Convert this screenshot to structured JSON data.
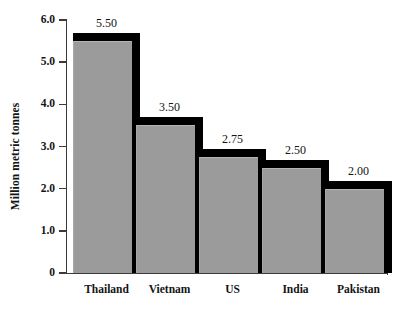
{
  "chart_data": {
    "type": "bar",
    "title": "",
    "subtitle": "",
    "xlabel": "",
    "ylabel": "Million metric tonnes",
    "categories": [
      "Thailand",
      "Vietnam",
      "US",
      "India",
      "Pakistan"
    ],
    "values": [
      5.5,
      3.5,
      2.75,
      2.5,
      2.0
    ],
    "data_labels": [
      "5.50",
      "3.50",
      "2.75",
      "2.50",
      "2.00"
    ],
    "ylim": [
      0,
      6.0
    ],
    "ytick_values": [
      6.0,
      5.0,
      4.0,
      3.0,
      2.0,
      1.0,
      0
    ],
    "ytick_labels": [
      "6.0",
      "5.0",
      "4.0",
      "3.0",
      "2.0",
      "1.0",
      "0"
    ],
    "grid": false,
    "legend": null,
    "legend_position": "none",
    "bar_color": "#9b9b9b",
    "bar_shadow_color": "#000000",
    "axis_color": "#3b3b3b",
    "background_color": "#ffffff",
    "text_color": "#141414"
  }
}
